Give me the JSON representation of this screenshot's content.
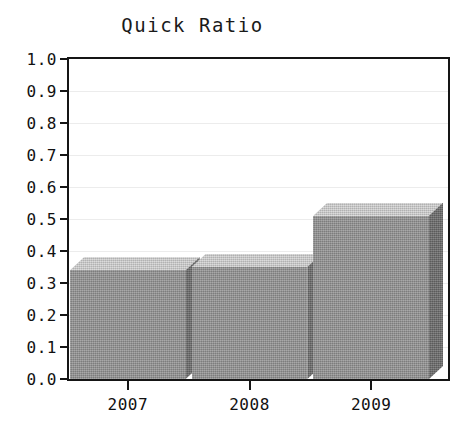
{
  "chart_data": {
    "type": "bar",
    "title": "Quick Ratio",
    "xlabel": "",
    "ylabel": "",
    "categories": [
      "2007",
      "2008",
      "2009"
    ],
    "values": [
      0.34,
      0.35,
      0.51
    ],
    "ylim": [
      0.0,
      1.0
    ],
    "ytick_labels": [
      "0.0",
      "0.1",
      "0.2",
      "0.3",
      "0.4",
      "0.5",
      "0.6",
      "0.7",
      "0.8",
      "0.9",
      "1.0"
    ],
    "ytick_values": [
      0.0,
      0.1,
      0.2,
      0.3,
      0.4,
      0.5,
      0.6,
      0.7,
      0.8,
      0.9,
      1.0
    ],
    "grid": true,
    "grid_axis": "y",
    "legend": false,
    "legend_position": "none",
    "style": "3d",
    "series": [
      {
        "name": "Quick Ratio",
        "values": [
          0.34,
          0.35,
          0.51
        ]
      }
    ],
    "colors": {
      "bar_front": "#8c8c8c",
      "bar_top": "#c2c2c2",
      "bar_side": "#6e6e6e",
      "axis": "#151515",
      "grid": "#ececec",
      "background": "#ffffff",
      "text": "#111111"
    }
  },
  "plot": {
    "left": 67,
    "top": 57,
    "width": 383,
    "height": 324,
    "depth_x": 14,
    "depth_y": 13,
    "bar_gap": 6
  }
}
